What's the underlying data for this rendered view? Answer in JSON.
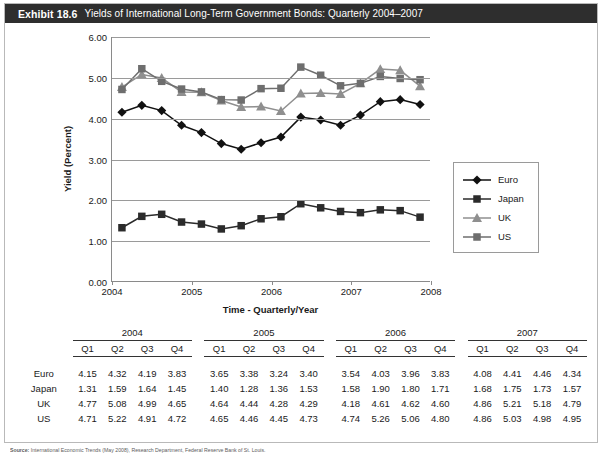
{
  "exhibit": {
    "number": "Exhibit 18.6",
    "title": "Yields of International Long-Term Government Bonds: Quarterly 2004–2007"
  },
  "source": {
    "label": "Source:",
    "text": "International Economic Trends (May 2008), Research Department, Federal Reserve Bank of St. Louis."
  },
  "colors": {
    "euro": "#111111",
    "japan": "#2b2b2b",
    "uk": "#8f8f8f",
    "us": "#6e6e6e",
    "grid": "#9a9a9a",
    "axis": "#8a8a8a",
    "header_bar": "#2e2e2e"
  },
  "chart_data": {
    "type": "line",
    "title": "Yields of International Long-Term Government Bonds: Quarterly 2004–2007",
    "xlabel": "Time - Quarterly/Year",
    "ylabel": "Yield (Percent)",
    "ylim": [
      0.0,
      6.0
    ],
    "ytick_labels": [
      "0.00",
      "1.00",
      "2.00",
      "3.00",
      "4.00",
      "5.00",
      "6.00"
    ],
    "yticks": [
      0,
      1,
      2,
      3,
      4,
      5,
      6
    ],
    "xtick_labels": [
      "2004",
      "2005",
      "2006",
      "2007",
      "2008"
    ],
    "xticks": [
      0,
      4,
      8,
      12,
      16
    ],
    "xlim": [
      0,
      16
    ],
    "grid": "horizontal",
    "legend_position": "right-outside",
    "x": [
      "2004 Q1",
      "2004 Q2",
      "2004 Q3",
      "2004 Q4",
      "2005 Q1",
      "2005 Q2",
      "2005 Q3",
      "2005 Q4",
      "2006 Q1",
      "2006 Q2",
      "2006 Q3",
      "2006 Q4",
      "2007 Q1",
      "2007 Q2",
      "2007 Q3",
      "2007 Q4"
    ],
    "series": [
      {
        "name": "Euro",
        "marker": "diamond",
        "color": "#111111",
        "values": [
          4.15,
          4.32,
          4.19,
          3.83,
          3.65,
          3.38,
          3.24,
          3.4,
          3.54,
          4.03,
          3.96,
          3.83,
          4.08,
          4.41,
          4.46,
          4.34
        ]
      },
      {
        "name": "Japan",
        "marker": "square",
        "color": "#2b2b2b",
        "values": [
          1.31,
          1.59,
          1.64,
          1.45,
          1.4,
          1.28,
          1.36,
          1.53,
          1.58,
          1.9,
          1.8,
          1.71,
          1.68,
          1.75,
          1.73,
          1.57
        ]
      },
      {
        "name": "UK",
        "marker": "triangle",
        "color": "#8f8f8f",
        "values": [
          4.77,
          5.08,
          4.99,
          4.65,
          4.64,
          4.44,
          4.28,
          4.29,
          4.18,
          4.61,
          4.62,
          4.6,
          4.86,
          5.21,
          5.18,
          4.79
        ]
      },
      {
        "name": "US",
        "marker": "square",
        "color": "#6e6e6e",
        "values": [
          4.71,
          5.22,
          4.91,
          4.72,
          4.65,
          4.46,
          4.45,
          4.73,
          4.74,
          5.26,
          5.06,
          4.8,
          4.86,
          5.03,
          4.98,
          4.95
        ]
      }
    ]
  },
  "legend": {
    "items": [
      {
        "label": "Euro"
      },
      {
        "label": "Japan"
      },
      {
        "label": "UK"
      },
      {
        "label": "US"
      }
    ]
  },
  "table": {
    "years": [
      "2004",
      "2005",
      "2006",
      "2007"
    ],
    "quarters": [
      "Q1",
      "Q2",
      "Q3",
      "Q4"
    ],
    "rows": [
      {
        "label": "Euro",
        "values": [
          "4.15",
          "4.32",
          "4.19",
          "3.83",
          "3.65",
          "3.38",
          "3.24",
          "3.40",
          "3.54",
          "4.03",
          "3.96",
          "3.83",
          "4.08",
          "4.41",
          "4.46",
          "4.34"
        ]
      },
      {
        "label": "Japan",
        "values": [
          "1.31",
          "1.59",
          "1.64",
          "1.45",
          "1.40",
          "1.28",
          "1.36",
          "1.53",
          "1.58",
          "1.90",
          "1.80",
          "1.71",
          "1.68",
          "1.75",
          "1.73",
          "1.57"
        ]
      },
      {
        "label": "UK",
        "values": [
          "4.77",
          "5.08",
          "4.99",
          "4.65",
          "4.64",
          "4.44",
          "4.28",
          "4.29",
          "4.18",
          "4.61",
          "4.62",
          "4.60",
          "4.86",
          "5.21",
          "5.18",
          "4.79"
        ]
      },
      {
        "label": "US",
        "values": [
          "4.71",
          "5.22",
          "4.91",
          "4.72",
          "4.65",
          "4.46",
          "4.45",
          "4.73",
          "4.74",
          "5.26",
          "5.06",
          "4.80",
          "4.86",
          "5.03",
          "4.98",
          "4.95"
        ]
      }
    ]
  }
}
